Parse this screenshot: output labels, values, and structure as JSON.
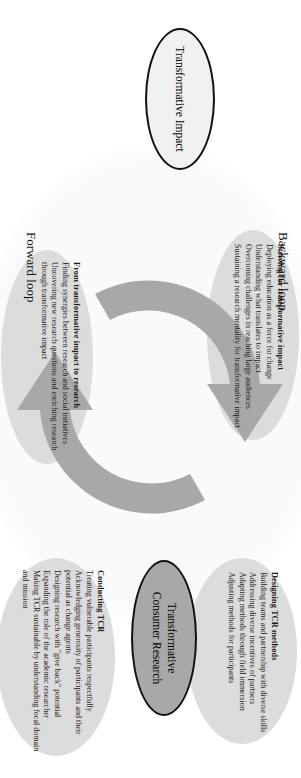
{
  "figure": {
    "orientation": "rotated-90-clockwise",
    "colors": {
      "panel_fill": "#dcdcdc",
      "arrow_fill": "#a8a8a8",
      "node_impact_fill": "#f1f1f1",
      "node_tcr_fill": "#a8a8a8",
      "outline": "#111111",
      "text": "#1a1a1a",
      "background": "#ffffff"
    }
  },
  "captions": {
    "forward_loop": "Forward loop",
    "backward_loop": "Backward loop"
  },
  "nodes": {
    "impact": {
      "label": "Transformative Impact"
    },
    "tcr": {
      "line1": "Transformative",
      "line2": "Consumer Research"
    }
  },
  "panels": [
    {
      "id": "striving",
      "heading": "Striving for transformative impact",
      "items": [
        "Deploying education as a force for change",
        "Understanding what translates to impact",
        "Overcoming challenges in reaching large audiences",
        "Sustaining a research mentality for transformative impact"
      ]
    },
    {
      "id": "from",
      "heading": "From transformative impact to research",
      "items": [
        "Finding synergies between research and social initiatives",
        "Uncovering new research questions and enriching research through transformative impact"
      ]
    },
    {
      "id": "designing",
      "heading": "Designing TCR methods",
      "items": [
        "Building teams and partnership with diverse skills",
        "Addressing diverse incentives of partners",
        "Adapting methods through field immersion",
        "Adjusting methods for participants"
      ]
    },
    {
      "id": "conducting",
      "heading": "Conducting TCR",
      "items": [
        "Treating vulnerable participants respectfully",
        "Acknowledging generosity of participants and their potential as change agents",
        "Designing research with \"give back\" potential",
        "Expanding the role of the academic researcher",
        "Making TCR sustainable by understanding focal domain and mission"
      ]
    }
  ],
  "arrows": {
    "top_arrow_name": "cycle-arrow-forward",
    "bottom_arrow_name": "cycle-arrow-backward"
  }
}
